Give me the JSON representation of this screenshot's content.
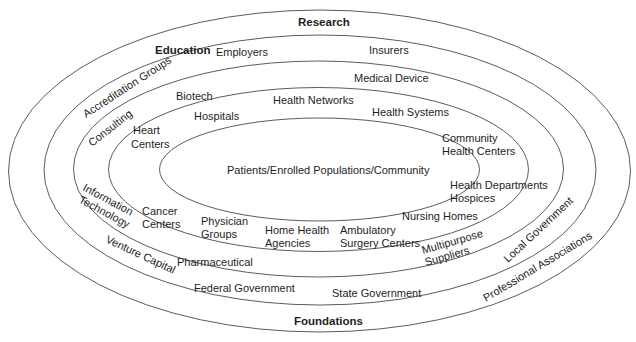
{
  "diagram": {
    "type": "concentric-ellipses",
    "center_label": "Patients/Enrolled Populations/Community",
    "rings": [
      {
        "level": 1,
        "name": "inner",
        "labels": [
          "Patients/Enrolled Populations/Community"
        ]
      },
      {
        "level": 2,
        "labels": [
          "Hospitals",
          "Heart Centers",
          "Community Health Centers",
          "Health Departments",
          "Hospices",
          "Nursing Homes",
          "Ambulatory Surgery Centers",
          "Home Health Agencies",
          "Physician Groups",
          "Cancer Centers"
        ]
      },
      {
        "level": 3,
        "labels": [
          "Biotech",
          "Health Networks",
          "Health Systems",
          "Multipurpose Suppliers",
          "Pharmaceutical",
          "Information Technology",
          "Consulting"
        ]
      },
      {
        "level": 4,
        "labels": [
          "Employers",
          "Insurers",
          "Medical Device",
          "Local Government",
          "State Government",
          "Federal Government",
          "Venture Capital",
          "Accreditation Groups"
        ]
      },
      {
        "level": 5,
        "name": "outer",
        "labels": [
          "Research",
          "Education",
          "Professional Associations",
          "Foundations"
        ]
      }
    ]
  },
  "labels": {
    "research": "Research",
    "education": "Education",
    "foundations": "Foundations",
    "employers": "Employers",
    "insurers": "Insurers",
    "accreditation_groups": "Accreditation Groups",
    "medical_device": "Medical Device",
    "biotech": "Biotech",
    "health_networks": "Health Networks",
    "consulting": "Consulting",
    "hospitals": "Hospitals",
    "health_systems": "Health Systems",
    "heart": "Heart",
    "centers": "Centers",
    "community": "Community",
    "health_centers": "Health Centers",
    "patients": "Patients/Enrolled Populations/Community",
    "health_departments": "Health Departments",
    "hospices": "Hospices",
    "information": "Information",
    "technology": "Technology",
    "cancer": "Cancer",
    "cancer_centers": "Centers",
    "physician": "Physician",
    "groups": "Groups",
    "home_health": "Home Health",
    "agencies": "Agencies",
    "ambulatory": "Ambulatory",
    "surgery_centers": "Surgery Centers",
    "nursing_homes": "Nursing Homes",
    "multipurpose": "Multipurpose",
    "suppliers": "Suppliers",
    "local_government": "Local Government",
    "venture_capital": "Venture Capital",
    "pharmaceutical": "Pharmaceutical",
    "federal_government": "Federal Government",
    "state_government": "State Government",
    "professional_associations": "Professional Associations"
  },
  "colors": {
    "stroke": "#4a4a4a",
    "text": "#1e1e1e",
    "background": "#ffffff"
  }
}
